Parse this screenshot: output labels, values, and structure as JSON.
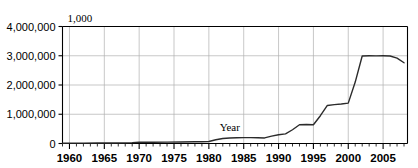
{
  "chart_data": {
    "type": "line",
    "title": "",
    "xlabel": "Year",
    "ylabel": "",
    "corner_note": "1,000",
    "grid": true,
    "legend": "none",
    "xlim": [
      1959,
      2008.5
    ],
    "ylim": [
      0,
      4000000
    ],
    "y_ticks": [
      0,
      1000000,
      2000000,
      3000000,
      4000000
    ],
    "y_tick_labels": [
      "0",
      "1,000,000",
      "2,000,000",
      "3,000,000",
      "4,000,000"
    ],
    "x_ticks": [
      1960,
      1965,
      1970,
      1975,
      1980,
      1985,
      1990,
      1995,
      2000,
      2005
    ],
    "x_tick_labels": [
      "1960",
      "1965",
      "1970",
      "1975",
      "1980",
      "1985",
      "1990",
      "1995",
      "2000",
      "2005"
    ],
    "x_minor_tick_step": 1,
    "annotations": [
      {
        "text": "Year",
        "x": 1983,
        "y": 430000
      }
    ],
    "series": [
      {
        "name": "value",
        "color": "#2b2b2b",
        "x": [
          1959,
          1960,
          1962,
          1964,
          1966,
          1968,
          1969,
          1970,
          1971,
          1972,
          1974,
          1976,
          1978,
          1979,
          1980,
          1981,
          1982,
          1983,
          1984,
          1985,
          1986,
          1987,
          1988,
          1989,
          1990,
          1991,
          1992,
          1993,
          1994,
          1995,
          1996,
          1997,
          1998,
          1999,
          2000,
          2001,
          2002,
          2003,
          2004,
          2005,
          2006,
          2007,
          2008
        ],
        "y": [
          10000,
          12000,
          14000,
          16000,
          18000,
          22000,
          30000,
          45000,
          45000,
          45000,
          48000,
          52000,
          58000,
          62000,
          70000,
          130000,
          170000,
          190000,
          195000,
          200000,
          200000,
          195000,
          190000,
          250000,
          300000,
          330000,
          470000,
          640000,
          650000,
          640000,
          950000,
          1300000,
          1330000,
          1350000,
          1380000,
          2100000,
          2990000,
          3000000,
          2995000,
          3000000,
          2990000,
          2920000,
          2760000
        ]
      }
    ]
  }
}
